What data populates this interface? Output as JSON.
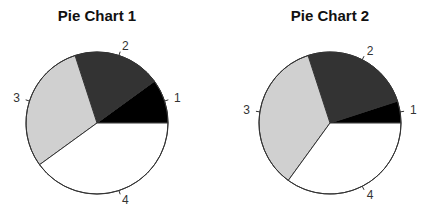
{
  "chart_data": [
    {
      "type": "pie",
      "title": "Pie Chart 1",
      "categories": [
        "1",
        "2",
        "3",
        "4"
      ],
      "values": [
        10,
        20,
        30,
        40
      ],
      "colors": [
        "#000000",
        "#333333",
        "#d0d0d0",
        "#ffffff"
      ],
      "start_angle_deg": 0,
      "direction": "counterclockwise",
      "legend": "none",
      "center": [
        97,
        123
      ],
      "radius": 71
    },
    {
      "type": "pie",
      "title": "Pie Chart 2",
      "categories": [
        "1",
        "2",
        "3",
        "4"
      ],
      "values": [
        5,
        25,
        35,
        35
      ],
      "colors": [
        "#000000",
        "#333333",
        "#d0d0d0",
        "#ffffff"
      ],
      "start_angle_deg": 0,
      "direction": "counterclockwise",
      "legend": "none",
      "center": [
        330,
        123
      ],
      "radius": 71
    }
  ]
}
